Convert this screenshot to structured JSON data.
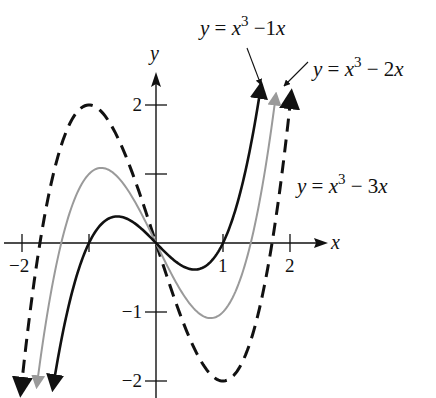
{
  "chart_data": {
    "type": "line",
    "title": "",
    "xlabel": "x",
    "ylabel": "y",
    "xlim": [
      -2.2,
      2.5
    ],
    "ylim": [
      -2.25,
      2.45
    ],
    "xticks": [
      {
        "value": -2,
        "label": "-2"
      },
      {
        "value": -1,
        "label": ""
      },
      {
        "value": 1,
        "label": "1"
      },
      {
        "value": 2,
        "label": "2"
      }
    ],
    "yticks": [
      {
        "value": 2,
        "label": "2"
      },
      {
        "value": 1,
        "label": ""
      },
      {
        "value": -1,
        "label": "-1"
      },
      {
        "value": -2,
        "label": "-2"
      }
    ],
    "grid": false,
    "series": [
      {
        "name": "y = x^3 - 1x",
        "label_parts": {
          "lhs": "y",
          "eq": " = ",
          "base": "x",
          "exp": "3",
          "rest": " −1",
          "var": "x"
        },
        "a": 1,
        "x_range": [
          -1.54,
          1.57
        ],
        "style": "solid",
        "color": "#111111",
        "annotation": "top-right with arrow"
      },
      {
        "name": "y = x^3 - 2x",
        "label_parts": {
          "lhs": "y",
          "eq": " = ",
          "base": "x",
          "exp": "3",
          "rest": " − 2",
          "var": "x"
        },
        "a": 2,
        "x_range": [
          -1.78,
          1.79
        ],
        "style": "solid",
        "color": "#9a9a9a",
        "annotation": "top-right with arrow"
      },
      {
        "name": "y = x^3 - 3x",
        "label_parts": {
          "lhs": "y",
          "eq": " = ",
          "base": "x",
          "exp": "3",
          "rest": " − 3",
          "var": "x"
        },
        "a": 3,
        "x_range": [
          -2.02,
          2.02
        ],
        "style": "dashed",
        "color": "#111111",
        "annotation": "right"
      }
    ]
  }
}
